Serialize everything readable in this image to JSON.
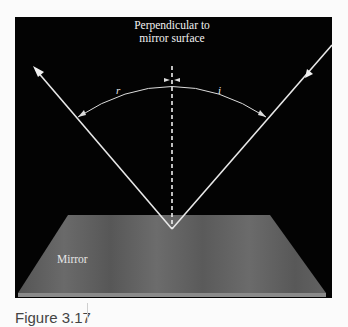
{
  "figure": {
    "caption": "Figure 3.17",
    "labels": {
      "perpendicular_line1": "Perpendicular to",
      "perpendicular_line2": "mirror surface",
      "reflected_angle": "r",
      "incident_angle": "i",
      "mirror": "Mirror"
    },
    "colors": {
      "background_panel": "#030303",
      "mirror_surface": "#5f5f5f",
      "mirror_edge": "#8a8a8a",
      "rays": "#e8e8e8",
      "page": "#fbfbfb"
    },
    "elements": {
      "incident_ray": "ray from upper right striking mirror, arrow pointing toward mirror",
      "reflected_ray": "ray leaving mirror toward upper left, arrowhead at end",
      "normal": "dashed vertical perpendicular at point of incidence",
      "angle_arc": "arc spanning reflected ray to incident ray, split by normal"
    }
  }
}
